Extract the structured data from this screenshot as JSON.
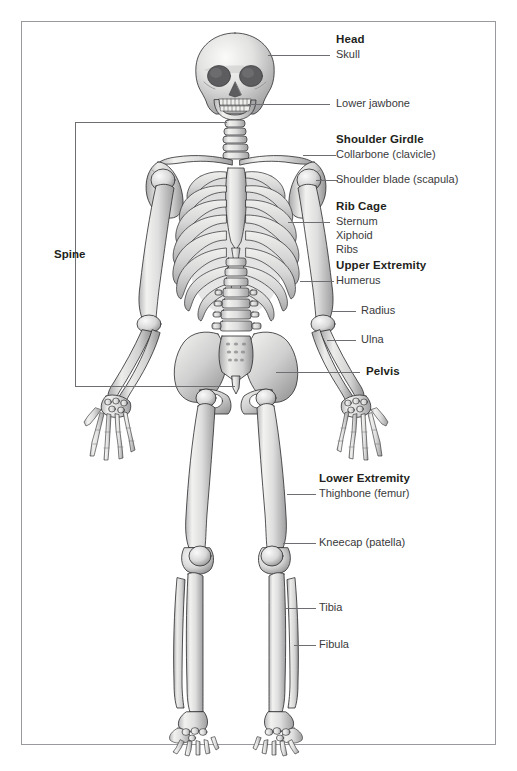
{
  "figure": {
    "frame_color": "#9a9a9e",
    "leader_color": "#6e6e72",
    "text_color": "#231f20",
    "subtext_color": "#3a3a3c",
    "background": "#ffffff"
  },
  "labels": {
    "head": "Head",
    "skull": "Skull",
    "lower_jawbone": "Lower jawbone",
    "shoulder_girdle": "Shoulder Girdle",
    "collarbone": "Collarbone (clavicle)",
    "shoulder_blade": "Shoulder blade (scapula)",
    "rib_cage": "Rib Cage",
    "sternum": "Sternum",
    "xiphoid": "Xiphoid",
    "ribs": "Ribs",
    "upper_extremity": "Upper Extremity",
    "humerus": "Humerus",
    "radius": "Radius",
    "ulna": "Ulna",
    "pelvis": "Pelvis",
    "spine": "Spine",
    "lower_extremity": "Lower Extremity",
    "thighbone": "Thighbone (femur)",
    "kneecap": "Kneecap (patella)",
    "tibia": "Tibia",
    "fibula": "Fibula"
  },
  "label_groups": [
    {
      "group": "Head",
      "items": [
        "Skull",
        "Lower jawbone"
      ]
    },
    {
      "group": "Shoulder Girdle",
      "items": [
        "Collarbone (clavicle)",
        "Shoulder blade (scapula)"
      ]
    },
    {
      "group": "Rib Cage",
      "items": [
        "Sternum",
        "Xiphoid",
        "Ribs"
      ]
    },
    {
      "group": "Upper Extremity",
      "items": [
        "Humerus",
        "Radius",
        "Ulna"
      ]
    },
    {
      "group": "Pelvis",
      "items": []
    },
    {
      "group": "Spine",
      "items": []
    },
    {
      "group": "Lower Extremity",
      "items": [
        "Thighbone (femur)",
        "Kneecap (patella)",
        "Tibia",
        "Fibula"
      ]
    }
  ]
}
